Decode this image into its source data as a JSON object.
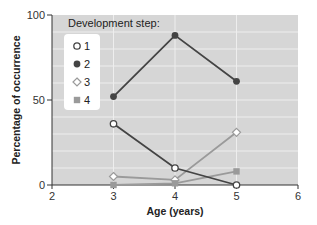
{
  "chart_data": {
    "type": "line",
    "title": "",
    "xlabel": "Age (years)",
    "ylabel": "Percentage of occurrence",
    "xlim": [
      2,
      6
    ],
    "ylim": [
      0,
      100
    ],
    "x_ticks": [
      2,
      3,
      4,
      5,
      6
    ],
    "y_ticks": [
      0,
      50,
      100
    ],
    "grid": true,
    "legend_title": "Development step:",
    "legend_position": "upper-left",
    "x": [
      3,
      4,
      5
    ],
    "series": [
      {
        "name": "1",
        "marker": "open-circle",
        "color": "#444444",
        "values": [
          36,
          10,
          0
        ]
      },
      {
        "name": "2",
        "marker": "filled-circle",
        "color": "#444444",
        "values": [
          52,
          88,
          61
        ]
      },
      {
        "name": "3",
        "marker": "open-diamond",
        "color": "#9a9a9a",
        "values": [
          5,
          3,
          31
        ]
      },
      {
        "name": "4",
        "marker": "filled-square",
        "color": "#9a9a9a",
        "values": [
          0,
          1,
          8
        ]
      }
    ]
  },
  "colors": {
    "plot_bg": "#d6d6d6",
    "grid": "#eeeeee",
    "dark_series": "#444444",
    "light_series": "#9a9a9a"
  }
}
